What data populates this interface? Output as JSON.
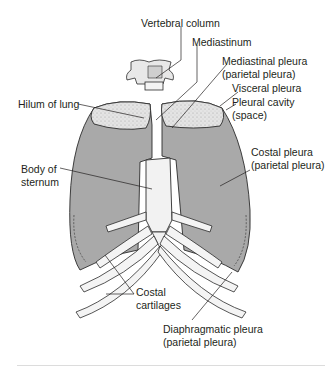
{
  "figure": {
    "colors": {
      "pleura_fill": "#a9a9a9",
      "lung_top": "#e2e2e2",
      "bone": "#f4f4f4",
      "outline": "#2b2b2b",
      "text": "#231f20",
      "divider": "#dcdcdc"
    },
    "labels": [
      {
        "id": "vertebral-column",
        "line1": "Vertebral column",
        "line2": ""
      },
      {
        "id": "mediastinum",
        "line1": "Mediastinum",
        "line2": ""
      },
      {
        "id": "mediastinal-pleura",
        "line1": "Mediastinal pleura",
        "line2": "(parietal pleura)"
      },
      {
        "id": "visceral-pleura",
        "line1": "Visceral pleura",
        "line2": ""
      },
      {
        "id": "pleural-cavity",
        "line1": "Pleural cavity",
        "line2": "(space)"
      },
      {
        "id": "hilum-of-lung",
        "line1": "Hilum of lung",
        "line2": ""
      },
      {
        "id": "costal-pleura",
        "line1": "Costal pleura",
        "line2": "(parietal pleura)"
      },
      {
        "id": "body-of-sternum",
        "line1": "Body of",
        "line2": "sternum"
      },
      {
        "id": "costal-cartilages",
        "line1": "Costal",
        "line2": "cartilages"
      },
      {
        "id": "diaphragmatic-pleura",
        "line1": "Diaphragmatic pleura",
        "line2": "(parietal pleura)"
      }
    ]
  }
}
